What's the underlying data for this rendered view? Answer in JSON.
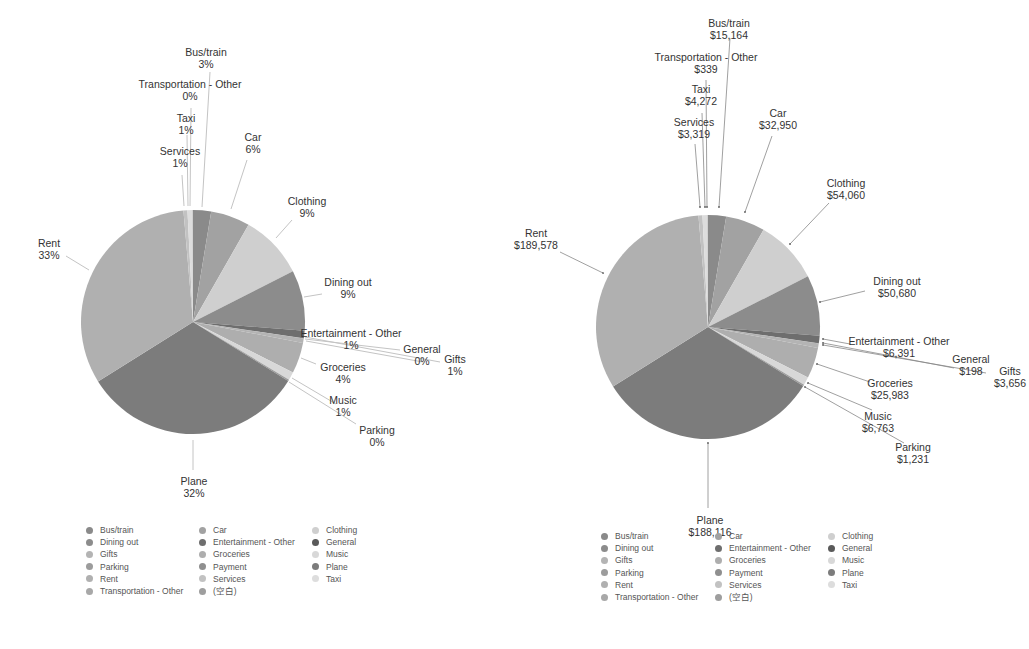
{
  "chart_data": [
    {
      "type": "pie",
      "title": "",
      "label_format": "percent",
      "categories": [
        "Bus/train",
        "Car",
        "Clothing",
        "Dining out",
        "Entertainment - Other",
        "General",
        "Gifts",
        "Groceries",
        "Music",
        "Parking",
        "Plane",
        "Rent",
        "Services",
        "Taxi",
        "Transportation - Other"
      ],
      "values": [
        3,
        6,
        9,
        9,
        1,
        0,
        1,
        4,
        1,
        0,
        32,
        33,
        1,
        1,
        0
      ],
      "value_labels": [
        "3%",
        "6%",
        "9%",
        "9%",
        "1%",
        "0%",
        "1%",
        "4%",
        "1%",
        "0%",
        "32%",
        "33%",
        "1%",
        "1%",
        "0%"
      ],
      "legend_position": "bottom",
      "legend": [
        "Bus/train",
        "Dining out",
        "Gifts",
        "Parking",
        "Rent",
        "Transportation - Other",
        "Car",
        "Entertainment - Other",
        "Groceries",
        "Payment",
        "Services",
        "(空白)",
        "Clothing",
        "General",
        "Music",
        "Plane",
        "Taxi"
      ]
    },
    {
      "type": "pie",
      "title": "",
      "label_format": "currency",
      "categories": [
        "Bus/train",
        "Car",
        "Clothing",
        "Dining out",
        "Entertainment - Other",
        "General",
        "Gifts",
        "Groceries",
        "Music",
        "Parking",
        "Plane",
        "Rent",
        "Services",
        "Taxi",
        "Transportation - Other"
      ],
      "values": [
        15164,
        32950,
        54060,
        50680,
        6391,
        198,
        3656,
        25983,
        6763,
        1231,
        188116,
        189578,
        3319,
        4272,
        339
      ],
      "value_labels": [
        "$15,164",
        "$32,950",
        "$54,060",
        "$50,680",
        "$6,391",
        "$198",
        "$3,656",
        "$25,983",
        "$6,763",
        "$1,231",
        "$188,116",
        "$189,578",
        "$3,319",
        "$4,272",
        "$339"
      ],
      "legend_position": "bottom",
      "legend": [
        "Bus/train",
        "Dining out",
        "Gifts",
        "Parking",
        "Rent",
        "Transportation - Other",
        "Car",
        "Entertainment - Other",
        "Groceries",
        "Payment",
        "Services",
        "(空白)",
        "Clothing",
        "General",
        "Music",
        "Plane",
        "Taxi"
      ]
    }
  ],
  "colors": {
    "Bus/train": "#8a8a8a",
    "Car": "#a2a2a2",
    "Clothing": "#cfcfcf",
    "Dining out": "#8c8c8c",
    "Entertainment - Other": "#6e6e6e",
    "General": "#5a5a5a",
    "Gifts": "#b4b4b4",
    "Groceries": "#aeaeae",
    "Music": "#d8d8d8",
    "Parking": "#9c9c9c",
    "Payment": "#8f8f8f",
    "Plane": "#7c7c7c",
    "Rent": "#b0b0b0",
    "Services": "#c2c2c2",
    "Taxi": "#dddddd",
    "Transportation - Other": "#a8a8a8",
    "(空白)": "#9e9e9e"
  },
  "left": {
    "labels": {
      "bus_train": {
        "name": "Bus/train",
        "value": "3%"
      },
      "transport_other": {
        "name": "Transportation - Other",
        "value": "0%"
      },
      "taxi": {
        "name": "Taxi",
        "value": "1%"
      },
      "services": {
        "name": "Services",
        "value": "1%"
      },
      "car": {
        "name": "Car",
        "value": "6%"
      },
      "clothing": {
        "name": "Clothing",
        "value": "9%"
      },
      "dining": {
        "name": "Dining out",
        "value": "9%"
      },
      "entertainment": {
        "name": "Entertainment - Other",
        "value": "1%"
      },
      "general": {
        "name": "General",
        "value": "0%"
      },
      "gifts": {
        "name": "Gifts",
        "value": "1%"
      },
      "groceries": {
        "name": "Groceries",
        "value": "4%"
      },
      "music": {
        "name": "Music",
        "value": "1%"
      },
      "parking": {
        "name": "Parking",
        "value": "0%"
      },
      "plane": {
        "name": "Plane",
        "value": "32%"
      },
      "rent": {
        "name": "Rent",
        "value": "33%"
      }
    }
  },
  "right": {
    "labels": {
      "bus_train": {
        "name": "Bus/train",
        "value": "$15,164"
      },
      "transport_other": {
        "name": "Transportation - Other",
        "value": "$339"
      },
      "taxi": {
        "name": "Taxi",
        "value": "$4,272"
      },
      "services": {
        "name": "Services",
        "value": "$3,319"
      },
      "car": {
        "name": "Car",
        "value": "$32,950"
      },
      "clothing": {
        "name": "Clothing",
        "value": "$54,060"
      },
      "dining": {
        "name": "Dining out",
        "value": "$50,680"
      },
      "entertainment": {
        "name": "Entertainment - Other",
        "value": "$6,391"
      },
      "general": {
        "name": "General",
        "value": "$198"
      },
      "gifts": {
        "name": "Gifts",
        "value": "$3,656"
      },
      "groceries": {
        "name": "Groceries",
        "value": "$25,983"
      },
      "music": {
        "name": "Music",
        "value": "$6,763"
      },
      "parking": {
        "name": "Parking",
        "value": "$1,231"
      },
      "plane": {
        "name": "Plane",
        "value": "$188,116"
      },
      "rent": {
        "name": "Rent",
        "value": "$189,578"
      }
    }
  },
  "legend": {
    "col1": [
      "Bus/train",
      "Dining out",
      "Gifts",
      "Parking",
      "Rent",
      "Transportation - Other"
    ],
    "col2": [
      "Car",
      "Entertainment - Other",
      "Groceries",
      "Payment",
      "Services",
      "(空白)"
    ],
    "col3": [
      "Clothing",
      "General",
      "Music",
      "Plane",
      "Taxi"
    ]
  }
}
